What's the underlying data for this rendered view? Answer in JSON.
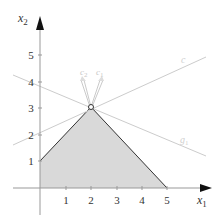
{
  "figure": {
    "axes": {
      "x_label": "x",
      "x_label_sub": "1",
      "y_label": "x",
      "y_label_sub": "2",
      "x_ticks": [
        "1",
        "2",
        "3",
        "4",
        "5"
      ],
      "y_ticks": [
        "1",
        "2",
        "3",
        "4",
        "5"
      ]
    },
    "feasible_region": {
      "vertices": [
        [
          0,
          0
        ],
        [
          0,
          1
        ],
        [
          2,
          3
        ],
        [
          5,
          0
        ]
      ],
      "fill": "#d9d9d9",
      "edge": "#333333"
    },
    "optimal_vertex": [
      2,
      3
    ],
    "vectors": [
      {
        "label": "c",
        "sub": "2"
      },
      {
        "label": "c",
        "sub": "1"
      }
    ],
    "lines": [
      {
        "label": "c",
        "sub": ""
      },
      {
        "label": "g",
        "sub": "1"
      }
    ],
    "colors": {
      "axis": "#999999",
      "guide_line": "#cccccc",
      "vector": "#bbbbbb",
      "region_fill": "#d9d9d9",
      "region_edge": "#333333"
    }
  }
}
